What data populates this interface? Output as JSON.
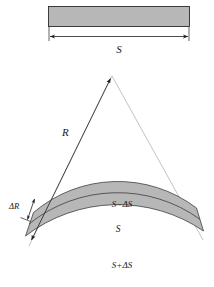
{
  "figure": {
    "background_color": "#ffffff",
    "fill_color": "#b7b7b7",
    "line_color": "#2b2b2b",
    "guide_color": "#9a9a9a"
  },
  "top_strip": {
    "name": "flat-strip",
    "dimension_label": "S",
    "dimension_arrow": "double-headed"
  },
  "fan": {
    "radius_label": "R",
    "radius_arrow": "double-headed",
    "thickness_label": "ΔR",
    "thickness_arrow": "double-headed",
    "arcs": {
      "inner_label": "S−ΔS",
      "middle_label": "S",
      "outer_label": "S+ΔS"
    }
  }
}
